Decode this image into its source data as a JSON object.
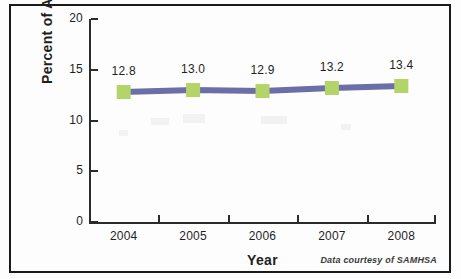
{
  "figure": {
    "background_color": "#fdfdfd",
    "border_color": "#1a1a1a",
    "credit": "Data courtesy of SAMHSA"
  },
  "chart_data": {
    "type": "line",
    "title": "",
    "subtitle": "",
    "xlabel": "Year",
    "ylabel": "Percent of Adults",
    "categories": [
      "2004",
      "2005",
      "2006",
      "2007",
      "2008"
    ],
    "x": [
      2004,
      2005,
      2006,
      2007,
      2008
    ],
    "values": [
      12.8,
      13.0,
      12.9,
      13.2,
      13.4
    ],
    "point_labels": [
      "12.8",
      "13.0",
      "12.9",
      "13.2",
      "13.4"
    ],
    "series": [
      {
        "name": "Percent of Adults",
        "values": [
          12.8,
          13.0,
          12.9,
          13.2,
          13.4
        ],
        "line_color": "#6b6fa8",
        "marker_color": "#b3d468",
        "marker_shape": "square"
      }
    ],
    "ylim": [
      0,
      20
    ],
    "yticks": [
      0,
      5,
      10,
      15,
      20
    ],
    "ytick_labels": [
      "0",
      "5",
      "10",
      "15",
      "20"
    ],
    "xtick_labels": [
      "2004",
      "2005",
      "2006",
      "2007",
      "2008"
    ],
    "grid": false,
    "legend": false,
    "legend_position": "none",
    "annotations": [
      "Data courtesy of SAMHSA"
    ]
  }
}
